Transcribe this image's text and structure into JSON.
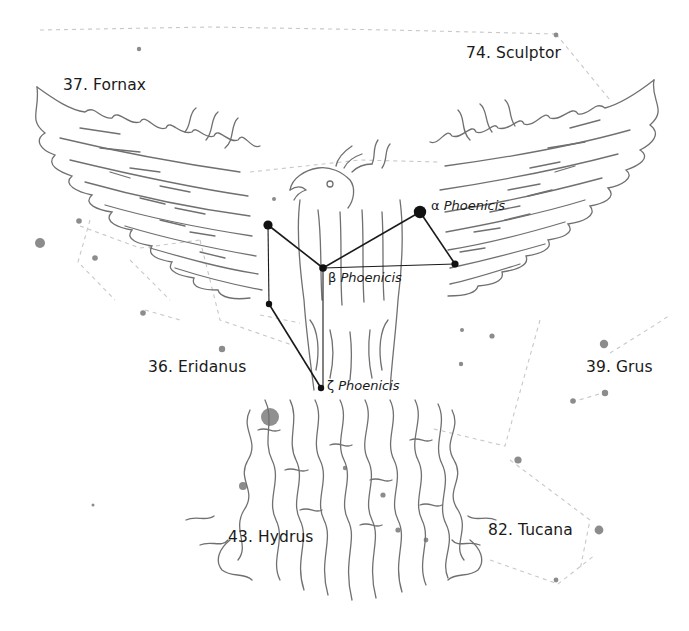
{
  "figure": {
    "title_constellation": "Phoenix",
    "neighbor_labels": [
      {
        "id": "fornax",
        "text": "37. Fornax",
        "x": 63,
        "y": 76
      },
      {
        "id": "sculptor",
        "text": "74. Sculptor",
        "x": 466,
        "y": 44
      },
      {
        "id": "eridanus",
        "text": "36. Eridanus",
        "x": 148,
        "y": 358
      },
      {
        "id": "grus",
        "text": "39. Grus",
        "x": 586,
        "y": 358
      },
      {
        "id": "hydrus",
        "text": "43. Hydrus",
        "x": 228,
        "y": 528
      },
      {
        "id": "tucana",
        "text": "82. Tucana",
        "x": 488,
        "y": 521
      }
    ],
    "star_labels": [
      {
        "id": "alpha",
        "greek": "α",
        "name": "Phoenicis",
        "x": 431,
        "y": 198
      },
      {
        "id": "beta",
        "greek": "β",
        "name": "Phoenicis",
        "x": 328,
        "y": 270
      },
      {
        "id": "zeta",
        "greek": "ζ",
        "name": "Phoenicis",
        "x": 327,
        "y": 378
      }
    ],
    "colors": {
      "text": "#1a1a1a",
      "stick_line": "#1a1a1a",
      "illustration": "#6e6e6e",
      "background_star": "#8a8a8a",
      "boundary": "#c4c4c4"
    }
  }
}
